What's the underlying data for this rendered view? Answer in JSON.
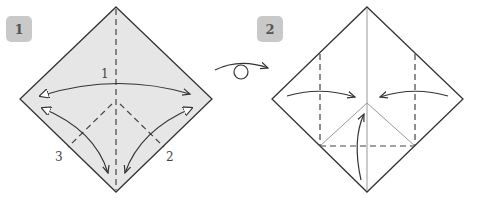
{
  "diagram": {
    "steps": [
      {
        "number": "1",
        "paper_color": "#e6e6e6",
        "fold_labels": [
          "1",
          "2",
          "3"
        ],
        "description": "Valley fold and unfold along the vertical and both lower diagonals"
      },
      {
        "number": "2",
        "paper_color": "#ffffff",
        "description": "Fold left, right and bottom corners to the center"
      }
    ],
    "turn_over_symbol": "turn-over-icon",
    "colors": {
      "line": "#333333",
      "crease": "#999999",
      "badge_bg": "#c9c9c9",
      "badge_text": "#555555"
    }
  }
}
